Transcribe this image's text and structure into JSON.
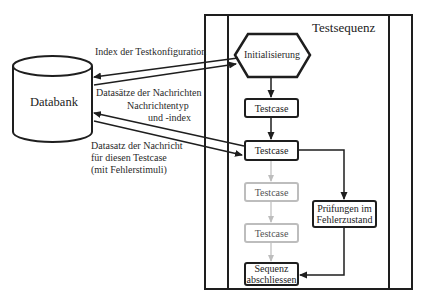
{
  "diagram": {
    "database": {
      "label": "Databank"
    },
    "sequence": {
      "title": "Testsequenz"
    },
    "nodes": {
      "init": "Initialisierung",
      "testcase_1": "Testcase",
      "testcase_2": "Testcase",
      "testcase_3": "Testcase",
      "testcase_4": "Testcase",
      "checks_line1": "Prüfungen im",
      "checks_line2": "Fehlerzustand",
      "end_line1": "Sequenz",
      "end_line2": "abschliessen"
    },
    "edge_labels": {
      "config_index": "Index der Testkonfiguration",
      "message_records": "Datasätze der Nachrichten",
      "msg_type_line1": "Nachrichtentyp",
      "msg_type_line2": "und -index",
      "msg_record_line1": "Datasatz der Nachricht",
      "msg_record_line2": "für diesen Testcase",
      "msg_record_line3": "(mit Fehlerstimuli)"
    },
    "colors": {
      "active": "#1e1e1e",
      "inactive": "#bdbdbd"
    }
  }
}
